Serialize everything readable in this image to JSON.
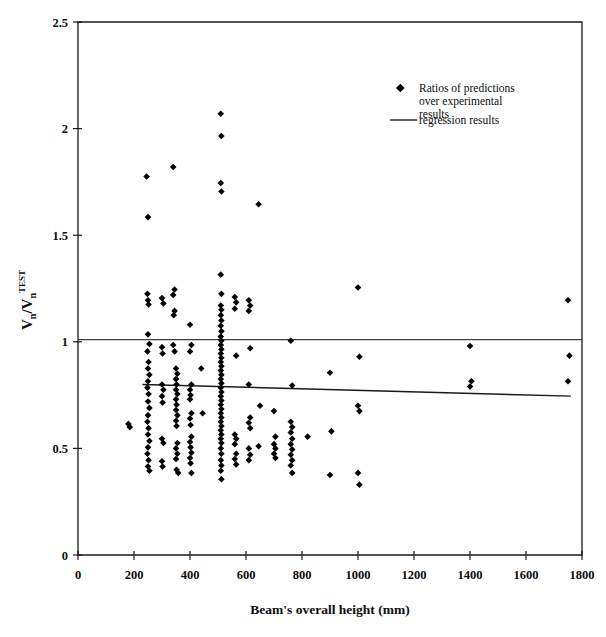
{
  "chart_data": {
    "type": "scatter",
    "title": "",
    "xlabel": "Beam's overall height (mm)",
    "ylabel": "Vn/Vn TEST",
    "ylabel_parts": {
      "num": "V",
      "num_sub": "n",
      "den": "V",
      "den_sub": "n",
      "den_sup": "TEST"
    },
    "xlim": [
      0,
      1800
    ],
    "ylim": [
      0,
      2.5
    ],
    "xticks": [
      0,
      200,
      400,
      600,
      800,
      1000,
      1200,
      1400,
      1600,
      1800
    ],
    "yticks": [
      0,
      0.5,
      1,
      1.5,
      2,
      2.5
    ],
    "xtick_labels": [
      "0",
      "200",
      "400",
      "600",
      "800",
      "1000",
      "1200",
      "1400",
      "1600",
      "1800"
    ],
    "ytick_labels": [
      "0",
      "0.5",
      "1",
      "1.5",
      "2",
      "2.5"
    ],
    "grid": false,
    "legend_position": "top-right-inside",
    "legend": [
      {
        "marker": "diamond",
        "label": "Ratios of predictions over experimental results"
      },
      {
        "marker": "line",
        "label": "regression results"
      }
    ],
    "reference_line": {
      "type": "horizontal",
      "y": 1.01,
      "color": "#3c3c3c"
    },
    "regression_line": {
      "x0": 230,
      "y0": 0.8,
      "x1": 1760,
      "y1": 0.745,
      "color": "#1a1a1a"
    },
    "series": [
      {
        "name": "Ratios of predictions over experimental results",
        "marker": "diamond",
        "color": "#000000",
        "points": [
          [
            180,
            0.615
          ],
          [
            185,
            0.6
          ],
          [
            245,
            1.775
          ],
          [
            250,
            1.585
          ],
          [
            248,
            1.225
          ],
          [
            250,
            1.195
          ],
          [
            252,
            1.175
          ],
          [
            250,
            1.035
          ],
          [
            255,
            0.99
          ],
          [
            248,
            0.955
          ],
          [
            252,
            0.905
          ],
          [
            250,
            0.875
          ],
          [
            255,
            0.845
          ],
          [
            250,
            0.815
          ],
          [
            248,
            0.785
          ],
          [
            252,
            0.755
          ],
          [
            250,
            0.72
          ],
          [
            255,
            0.69
          ],
          [
            250,
            0.655
          ],
          [
            248,
            0.625
          ],
          [
            252,
            0.595
          ],
          [
            250,
            0.565
          ],
          [
            255,
            0.535
          ],
          [
            250,
            0.505
          ],
          [
            248,
            0.475
          ],
          [
            252,
            0.445
          ],
          [
            250,
            0.415
          ],
          [
            255,
            0.395
          ],
          [
            300,
            1.205
          ],
          [
            305,
            1.18
          ],
          [
            300,
            0.975
          ],
          [
            302,
            0.945
          ],
          [
            300,
            0.8
          ],
          [
            305,
            0.775
          ],
          [
            300,
            0.745
          ],
          [
            302,
            0.715
          ],
          [
            300,
            0.545
          ],
          [
            305,
            0.525
          ],
          [
            300,
            0.44
          ],
          [
            302,
            0.415
          ],
          [
            340,
            1.82
          ],
          [
            345,
            1.245
          ],
          [
            340,
            1.22
          ],
          [
            345,
            1.145
          ],
          [
            342,
            1.125
          ],
          [
            340,
            0.985
          ],
          [
            345,
            0.955
          ],
          [
            350,
            0.875
          ],
          [
            355,
            0.85
          ],
          [
            350,
            0.825
          ],
          [
            352,
            0.8
          ],
          [
            350,
            0.775
          ],
          [
            355,
            0.755
          ],
          [
            350,
            0.73
          ],
          [
            352,
            0.705
          ],
          [
            350,
            0.68
          ],
          [
            355,
            0.655
          ],
          [
            350,
            0.63
          ],
          [
            352,
            0.605
          ],
          [
            355,
            0.525
          ],
          [
            350,
            0.5
          ],
          [
            355,
            0.475
          ],
          [
            350,
            0.45
          ],
          [
            352,
            0.4
          ],
          [
            358,
            0.385
          ],
          [
            400,
            1.08
          ],
          [
            405,
            0.985
          ],
          [
            400,
            0.955
          ],
          [
            405,
            0.8
          ],
          [
            400,
            0.775
          ],
          [
            402,
            0.75
          ],
          [
            400,
            0.73
          ],
          [
            405,
            0.665
          ],
          [
            400,
            0.64
          ],
          [
            402,
            0.61
          ],
          [
            405,
            0.555
          ],
          [
            400,
            0.53
          ],
          [
            402,
            0.505
          ],
          [
            405,
            0.48
          ],
          [
            400,
            0.455
          ],
          [
            402,
            0.43
          ],
          [
            405,
            0.385
          ],
          [
            440,
            0.875
          ],
          [
            445,
            0.665
          ],
          [
            510,
            2.07
          ],
          [
            512,
            1.965
          ],
          [
            510,
            1.745
          ],
          [
            512,
            1.705
          ],
          [
            510,
            1.315
          ],
          [
            512,
            1.225
          ],
          [
            510,
            1.17
          ],
          [
            512,
            1.15
          ],
          [
            510,
            1.125
          ],
          [
            512,
            1.1
          ],
          [
            510,
            1.075
          ],
          [
            512,
            1.05
          ],
          [
            510,
            1.025
          ],
          [
            512,
            1.005
          ],
          [
            510,
            0.985
          ],
          [
            512,
            0.965
          ],
          [
            510,
            0.945
          ],
          [
            512,
            0.925
          ],
          [
            510,
            0.905
          ],
          [
            512,
            0.885
          ],
          [
            510,
            0.865
          ],
          [
            512,
            0.845
          ],
          [
            510,
            0.825
          ],
          [
            512,
            0.805
          ],
          [
            510,
            0.785
          ],
          [
            512,
            0.765
          ],
          [
            510,
            0.745
          ],
          [
            512,
            0.725
          ],
          [
            510,
            0.705
          ],
          [
            512,
            0.685
          ],
          [
            510,
            0.665
          ],
          [
            512,
            0.645
          ],
          [
            510,
            0.625
          ],
          [
            512,
            0.605
          ],
          [
            510,
            0.585
          ],
          [
            512,
            0.565
          ],
          [
            510,
            0.545
          ],
          [
            512,
            0.525
          ],
          [
            510,
            0.5
          ],
          [
            512,
            0.475
          ],
          [
            510,
            0.445
          ],
          [
            512,
            0.42
          ],
          [
            510,
            0.395
          ],
          [
            512,
            0.355
          ],
          [
            560,
            1.21
          ],
          [
            565,
            1.185
          ],
          [
            560,
            1.155
          ],
          [
            565,
            0.935
          ],
          [
            560,
            0.565
          ],
          [
            565,
            0.545
          ],
          [
            560,
            0.52
          ],
          [
            565,
            0.475
          ],
          [
            560,
            0.45
          ],
          [
            565,
            0.425
          ],
          [
            610,
            1.195
          ],
          [
            615,
            1.17
          ],
          [
            610,
            1.145
          ],
          [
            615,
            0.97
          ],
          [
            610,
            0.8
          ],
          [
            615,
            0.645
          ],
          [
            610,
            0.62
          ],
          [
            615,
            0.595
          ],
          [
            610,
            0.5
          ],
          [
            615,
            0.47
          ],
          [
            610,
            0.445
          ],
          [
            645,
            1.645
          ],
          [
            650,
            0.7
          ],
          [
            645,
            0.51
          ],
          [
            700,
            0.675
          ],
          [
            705,
            0.555
          ],
          [
            700,
            0.52
          ],
          [
            705,
            0.5
          ],
          [
            700,
            0.475
          ],
          [
            705,
            0.455
          ],
          [
            760,
            1.005
          ],
          [
            765,
            0.795
          ],
          [
            760,
            0.625
          ],
          [
            765,
            0.6
          ],
          [
            760,
            0.575
          ],
          [
            765,
            0.545
          ],
          [
            760,
            0.52
          ],
          [
            765,
            0.495
          ],
          [
            760,
            0.47
          ],
          [
            765,
            0.445
          ],
          [
            760,
            0.42
          ],
          [
            765,
            0.385
          ],
          [
            820,
            0.555
          ],
          [
            900,
            0.855
          ],
          [
            905,
            0.58
          ],
          [
            900,
            0.375
          ],
          [
            1000,
            1.255
          ],
          [
            1005,
            0.93
          ],
          [
            1000,
            0.7
          ],
          [
            1005,
            0.675
          ],
          [
            1000,
            0.385
          ],
          [
            1005,
            0.33
          ],
          [
            1400,
            0.98
          ],
          [
            1405,
            0.815
          ],
          [
            1400,
            0.79
          ],
          [
            1750,
            1.195
          ],
          [
            1755,
            0.935
          ],
          [
            1750,
            0.815
          ]
        ]
      }
    ]
  }
}
